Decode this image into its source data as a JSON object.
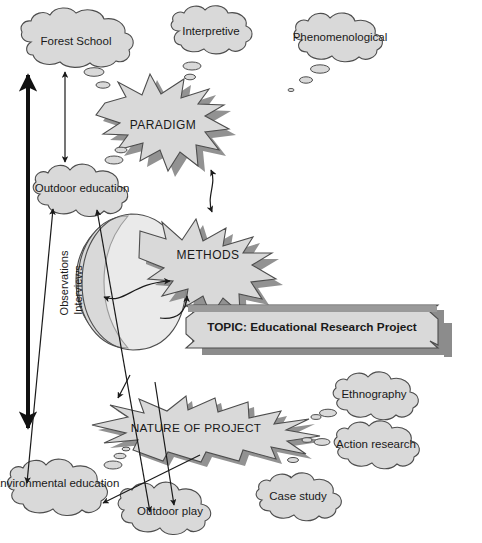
{
  "diagram": {
    "background_color": "#ffffff",
    "shape_fill": "#d9d9d9",
    "shape_stroke": "#4d4d4d",
    "shadow_color": "#8c8c8c",
    "text_color": "#1a1a1a",
    "arrow_color": "#1a1a1a"
  },
  "banner": {
    "label": "TOPIC: Educational Research Project",
    "shape": "plaque-ribbon"
  },
  "starbursts": [
    {
      "id": "paradigm",
      "label": "PARADIGM"
    },
    {
      "id": "methods",
      "label": "METHODS"
    },
    {
      "id": "nature",
      "label": "NATURE OF PROJECT"
    }
  ],
  "crescents": [
    {
      "id": "observations",
      "label": "Observations"
    },
    {
      "id": "interviews",
      "label": "Interviews"
    }
  ],
  "clouds": [
    {
      "id": "forest-school",
      "label": "Forest School"
    },
    {
      "id": "interpretive",
      "label": "Interpretive"
    },
    {
      "id": "phenomenological",
      "label": "Phenomenological"
    },
    {
      "id": "outdoor-education",
      "label": "Outdoor education"
    },
    {
      "id": "ethnography",
      "label": "Ethnography"
    },
    {
      "id": "action-research",
      "label": "Action research"
    },
    {
      "id": "case-study",
      "label": "Case study"
    },
    {
      "id": "environmental-education",
      "label": "Environmental education"
    },
    {
      "id": "outdoor-play",
      "label": "Outdoor play"
    }
  ],
  "connectors": [
    {
      "id": "thick-vertical-double-arrow",
      "heads": "both"
    },
    {
      "id": "thin-vertical-double-arrow",
      "heads": "both"
    },
    {
      "id": "paradigm-methods-double-arrow",
      "heads": "both"
    },
    {
      "id": "methods-observations-double-arrow",
      "heads": "both"
    },
    {
      "id": "methods-topic-double-arrow",
      "heads": "both"
    },
    {
      "id": "outdoor-education-to-environmental-education",
      "heads": "both"
    },
    {
      "id": "outdoor-education-to-outdoor-play",
      "heads": "both"
    },
    {
      "id": "nature-to-outdoor-play",
      "heads": "one"
    },
    {
      "id": "nature-to-environmental-education",
      "heads": "one"
    }
  ]
}
